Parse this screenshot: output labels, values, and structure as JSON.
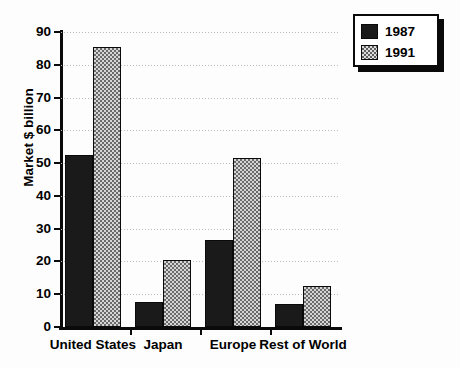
{
  "chart_data": {
    "type": "bar",
    "title": "",
    "subtitle": "",
    "xlabel": "",
    "ylabel": "Market $ billion",
    "categories": [
      "United States",
      "Japan",
      "Europe",
      "Rest of World"
    ],
    "series": [
      {
        "name": "1987",
        "values": [
          52.5,
          7.5,
          26.5,
          7.0
        ],
        "color": "#1a1a1a",
        "fill": "solid-black"
      },
      {
        "name": "1991",
        "values": [
          85.5,
          20.5,
          51.5,
          12.5
        ],
        "color": "#8f8f8f",
        "fill": "gray-checkered"
      }
    ],
    "ylim": [
      0,
      90
    ],
    "ytick_values": [
      0,
      10,
      20,
      30,
      40,
      50,
      60,
      70,
      80,
      90
    ],
    "ytick_labels": [
      "0",
      "10",
      "20",
      "30",
      "40",
      "50",
      "60",
      "70",
      "80",
      "90"
    ],
    "grid": "horizontal-dotted",
    "legend_position": "top-right",
    "legend_entries": [
      "1987",
      "1991"
    ]
  }
}
